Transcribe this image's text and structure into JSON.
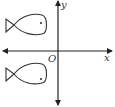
{
  "diagram": {
    "type": "coordinate-plane-reflection",
    "axes": {
      "x_label": "x",
      "y_label": "y",
      "origin_label": "O"
    },
    "figures": [
      {
        "name": "fish-upper",
        "quadrant": "II",
        "position": "above x-axis"
      },
      {
        "name": "fish-lower",
        "quadrant": "III",
        "position": "below x-axis"
      }
    ],
    "colors": {
      "stroke": "#333333",
      "background": "#ffffff"
    }
  }
}
